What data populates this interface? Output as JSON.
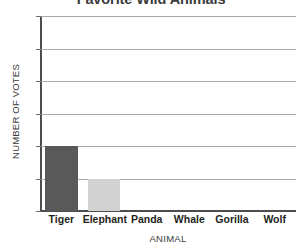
{
  "chart_data": {
    "type": "bar",
    "title": "Favorite Wild Animals",
    "xlabel": "ANIMAL",
    "ylabel": "NUMBER OF VOTES",
    "categories": [
      "Tiger",
      "Elephant",
      "Panda",
      "Whale",
      "Gorilla",
      "Wolf"
    ],
    "values": [
      4,
      2,
      0,
      0,
      0,
      0
    ],
    "bar_colors": [
      "#595959",
      "#d2d2d2",
      "#d2d2d2",
      "#d2d2d2",
      "#d2d2d2",
      "#d2d2d2"
    ],
    "ylim": [
      0,
      12
    ],
    "yticks": [
      0,
      2,
      4,
      6,
      8,
      10,
      12
    ],
    "ytick_labels": [
      "0",
      "2",
      "4",
      "6",
      "8",
      "10",
      "12"
    ],
    "grid": true,
    "legend": false,
    "legend_position": "none",
    "axis_color": "#4d4d4d",
    "gridline_color": "#a8a8a8",
    "background_color": "#ffffff"
  }
}
